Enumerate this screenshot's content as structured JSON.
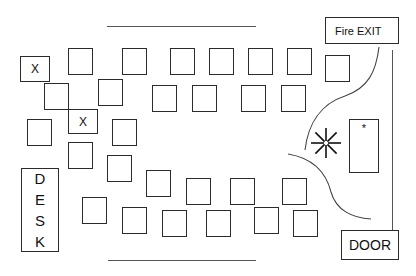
{
  "diagram": {
    "labels": {
      "fire_exit": "Fire EXIT",
      "door": "DOOR",
      "desk_letters": [
        "D",
        "E",
        "S",
        "K"
      ],
      "marked_seat": "X",
      "table_marker": "*"
    },
    "colors": {
      "stroke": "#2b2b2b",
      "line": "#555555",
      "background": "#ffffff",
      "text": "#111111"
    },
    "walls": {
      "top_line": {
        "x": 107,
        "y": 26,
        "w": 149
      },
      "bottom_line": {
        "x": 108,
        "y": 260,
        "w": 148
      },
      "right_line": {
        "x": 392,
        "y": 50,
        "h": 189
      }
    },
    "fire_exit_box": {
      "x": 325,
      "y": 17,
      "w": 74,
      "h": 27
    },
    "door_box": {
      "x": 341,
      "y": 230,
      "w": 58,
      "h": 30
    },
    "desk_box": {
      "x": 21,
      "y": 168,
      "w": 38,
      "h": 84
    },
    "side_table": {
      "x": 349,
      "y": 119,
      "w": 30,
      "h": 54
    },
    "starburst": {
      "cx": 326,
      "cy": 143,
      "r": 15
    },
    "marked_seats": [
      {
        "x": 20,
        "y": 56,
        "w": 30,
        "h": 26,
        "label": "X"
      },
      {
        "x": 68,
        "y": 109,
        "w": 30,
        "h": 25,
        "label": "X"
      }
    ],
    "seats": [
      {
        "x": 68,
        "y": 48
      },
      {
        "x": 122,
        "y": 48
      },
      {
        "x": 170,
        "y": 48
      },
      {
        "x": 209,
        "y": 48
      },
      {
        "x": 248,
        "y": 48
      },
      {
        "x": 287,
        "y": 48
      },
      {
        "x": 325,
        "y": 55
      },
      {
        "x": 44,
        "y": 83
      },
      {
        "x": 98,
        "y": 79
      },
      {
        "x": 152,
        "y": 85
      },
      {
        "x": 192,
        "y": 85
      },
      {
        "x": 241,
        "y": 85
      },
      {
        "x": 281,
        "y": 85
      },
      {
        "x": 27,
        "y": 119
      },
      {
        "x": 112,
        "y": 119
      },
      {
        "x": 68,
        "y": 142
      },
      {
        "x": 107,
        "y": 155
      },
      {
        "x": 146,
        "y": 170
      },
      {
        "x": 186,
        "y": 178
      },
      {
        "x": 230,
        "y": 178
      },
      {
        "x": 282,
        "y": 178
      },
      {
        "x": 82,
        "y": 197
      },
      {
        "x": 122,
        "y": 207
      },
      {
        "x": 162,
        "y": 210
      },
      {
        "x": 206,
        "y": 210
      },
      {
        "x": 254,
        "y": 207
      },
      {
        "x": 293,
        "y": 210
      }
    ],
    "seat_size": {
      "w": 25,
      "h": 27
    },
    "curves": {
      "upper_door_swing": "M 379 47 C 376 72, 368 88, 345 96 C 320 104, 308 125, 305 150",
      "lower_door_swing": "M 288 154 C 312 158, 326 172, 331 192 C 336 210, 352 218, 371 219"
    }
  }
}
